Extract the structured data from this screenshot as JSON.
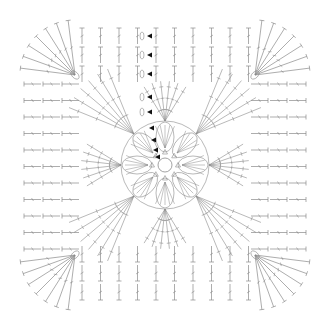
{
  "diagram": {
    "type": "crochet-chart",
    "colors": {
      "stitch": "#8a8a8a",
      "marker": "#111111",
      "background": "#ffffff"
    },
    "center": {
      "ring": "magic-ring",
      "inner_stitches": 8,
      "flower_petals": 8
    },
    "fans": {
      "corner_fans": 4,
      "side_fans": 4,
      "fan_strands": 6
    },
    "edge_rows": 7,
    "row_start_markers": 9
  }
}
